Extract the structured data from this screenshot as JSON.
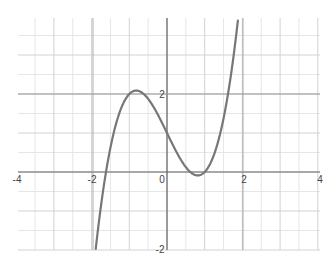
{
  "chart_data": {
    "type": "line",
    "title": "",
    "xlabel": "",
    "ylabel": "",
    "function": "f(x) = x^3 - 2x + 1",
    "xlim": [
      -4,
      4
    ],
    "ylim": [
      -2,
      3.9
    ],
    "grid": true,
    "grid_minor_step": 0.5,
    "x_tick_labels": [
      "-4",
      "-2",
      "0",
      "2",
      "4"
    ],
    "y_tick_labels": [
      "2",
      "-2"
    ],
    "series": [
      {
        "name": "f(x)",
        "color": "#777777",
        "x": [
          -1.95,
          -1.8,
          -1.618,
          -1.4,
          -1.2,
          -1.0,
          -0.816,
          -0.6,
          -0.4,
          -0.2,
          0,
          0.2,
          0.4,
          0.6,
          0.816,
          1.0,
          1.2,
          1.4,
          1.618,
          1.8,
          1.87
        ],
        "values": [
          -2.51,
          -1.23,
          0,
          1.06,
          1.67,
          2.0,
          2.09,
          1.98,
          1.74,
          1.39,
          1.0,
          0.61,
          0.26,
          -0.02,
          -0.09,
          0.0,
          0.33,
          0.94,
          2.0,
          3.23,
          3.8
        ]
      }
    ],
    "annotations": {
      "local_max": [
        -0.816,
        2.09
      ],
      "local_min": [
        0.816,
        -0.09
      ],
      "y_intercept": [
        0,
        1
      ]
    }
  },
  "labels": {
    "x_neg4": "-4",
    "x_neg2": "-2",
    "origin": "0",
    "x_2": "2",
    "x_4": "4",
    "y_2": "2",
    "y_neg2": "-2"
  }
}
